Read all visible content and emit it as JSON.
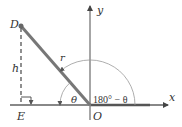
{
  "diagram": {
    "type": "geometry",
    "colors": {
      "axis": "#888888",
      "rod": "#777777",
      "arc": "#999999",
      "text": "#333333",
      "point": "#666666"
    },
    "labels": {
      "point_d": "D",
      "point_e": "E",
      "origin": "O",
      "height": "h",
      "radius": "r",
      "theta": "θ",
      "supplement": "180° − θ",
      "x_axis": "x",
      "y_axis": "y"
    },
    "geometry": {
      "origin": [
        90,
        105
      ],
      "point_d": [
        21,
        26
      ],
      "point_e": [
        21,
        105
      ],
      "theta_arc_radius": 30,
      "supplement_arc_radius": 45
    }
  }
}
